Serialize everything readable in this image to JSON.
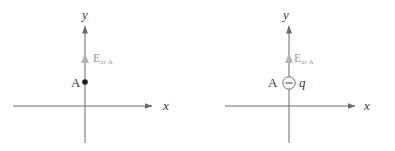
{
  "figure": {
    "background_color": "#ffffff",
    "stroke_color": "#6b6b6b",
    "text_color": "#3a3a3a",
    "field_color": "#9a9a9a",
    "point_color": "#1a1a1a"
  },
  "panels": [
    {
      "id": "left",
      "axes": {
        "x_label": "x",
        "y_label": "y"
      },
      "point": {
        "label": "A",
        "marker": "filled-dot"
      },
      "field_vector": {
        "label": "E",
        "subscript": "at A",
        "direction": "up"
      }
    },
    {
      "id": "right",
      "axes": {
        "x_label": "x",
        "y_label": "y"
      },
      "point": {
        "label": "A",
        "marker": "circled-minus"
      },
      "charge": {
        "label": "q",
        "sign": "negative",
        "sign_glyph": "−"
      },
      "field_vector": {
        "label": "E",
        "subscript": "at A",
        "direction": "up"
      }
    }
  ]
}
